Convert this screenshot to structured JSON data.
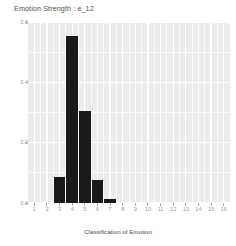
{
  "chart_data": {
    "type": "bar",
    "title": "Emotion Strength : e_12",
    "xlabel": "Classification of Emotion",
    "ylabel": "",
    "categories": [
      1,
      2,
      3,
      4,
      5,
      6,
      7,
      8,
      9,
      10,
      11,
      12,
      13,
      14,
      15,
      16
    ],
    "tick_labels": [
      "1",
      "2",
      "3",
      "4",
      "5",
      "6",
      "7",
      "8",
      "9",
      "10",
      "11",
      "12",
      "13",
      "14",
      "15",
      "16"
    ],
    "values": [
      0.0,
      0.0,
      0.085,
      0.555,
      0.305,
      0.075,
      0.012,
      0.0,
      0.0,
      0.0,
      0.0,
      0.0,
      0.0,
      0.0,
      0.0,
      0.0
    ],
    "ylim": [
      0.0,
      0.6
    ],
    "y_tick_labels": [
      "0.0",
      "0.2",
      "0.4",
      "0.6"
    ],
    "y_tick_values": [
      0.0,
      0.2,
      0.4,
      0.6
    ],
    "bar_color": "#1a1a1a",
    "panel_color": "#ebebeb",
    "grid_color": "#ffffff",
    "grid": true,
    "legend": "none"
  },
  "caption": ""
}
